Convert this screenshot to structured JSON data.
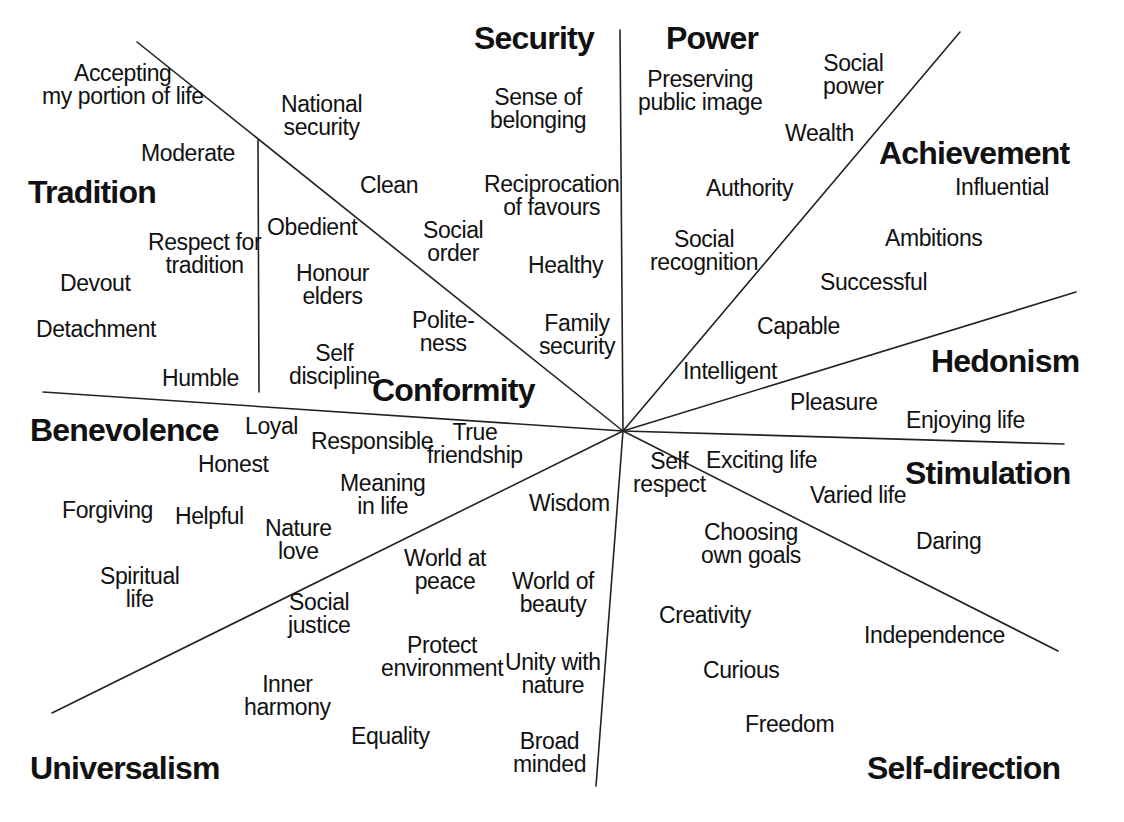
{
  "diagram": {
    "type": "radial-partition",
    "background": "#ffffff",
    "line_color": "#222222",
    "center": {
      "x": 623,
      "y": 431
    }
  },
  "domains": [
    {
      "id": "security",
      "label": "Security",
      "x": 474,
      "y": 22,
      "align": "l"
    },
    {
      "id": "power",
      "label": "Power",
      "x": 666,
      "y": 22,
      "align": "l"
    },
    {
      "id": "achievement",
      "label": "Achievement",
      "x": 879,
      "y": 137,
      "align": "l"
    },
    {
      "id": "hedonism",
      "label": "Hedonism",
      "x": 931,
      "y": 345,
      "align": "l"
    },
    {
      "id": "stimulation",
      "label": "Stimulation",
      "x": 905,
      "y": 457,
      "align": "l"
    },
    {
      "id": "self-direction",
      "label": "Self-direction",
      "x": 867,
      "y": 752,
      "align": "l"
    },
    {
      "id": "universalism",
      "label": "Universalism",
      "x": 30,
      "y": 752,
      "align": "l"
    },
    {
      "id": "benevolence",
      "label": "Benevolence",
      "x": 30,
      "y": 414,
      "align": "l"
    },
    {
      "id": "conformity",
      "label": "Conformity",
      "x": 372,
      "y": 374,
      "align": "l"
    },
    {
      "id": "tradition",
      "label": "Tradition",
      "x": 28,
      "y": 176,
      "align": "l"
    }
  ],
  "values": [
    {
      "domain": "tradition",
      "text": "Accepting\nmy portion of life",
      "x": 42,
      "y": 62,
      "align": "l"
    },
    {
      "domain": "tradition",
      "text": "Moderate",
      "x": 141,
      "y": 142,
      "align": "l"
    },
    {
      "domain": "tradition",
      "text": "Respect for\ntradition",
      "x": 148,
      "y": 231,
      "align": "l"
    },
    {
      "domain": "tradition",
      "text": "Devout",
      "x": 60,
      "y": 272,
      "align": "l"
    },
    {
      "domain": "tradition",
      "text": "Detachment",
      "x": 36,
      "y": 318,
      "align": "l"
    },
    {
      "domain": "tradition",
      "text": "Humble",
      "x": 162,
      "y": 367,
      "align": "l"
    },
    {
      "domain": "conformity",
      "text": "National\nsecurity",
      "x": 281,
      "y": 93,
      "align": "l"
    },
    {
      "domain": "conformity",
      "text": "Obedient",
      "x": 267,
      "y": 216,
      "align": "l"
    },
    {
      "domain": "conformity",
      "text": "Honour\nelders",
      "x": 296,
      "y": 262,
      "align": "l"
    },
    {
      "domain": "conformity",
      "text": "Self\ndiscipline",
      "x": 289,
      "y": 342,
      "align": "l"
    },
    {
      "domain": "conformity",
      "text": "Clean",
      "x": 360,
      "y": 174,
      "align": "l"
    },
    {
      "domain": "conformity",
      "text": "Social\norder",
      "x": 423,
      "y": 219,
      "align": "l"
    },
    {
      "domain": "conformity",
      "text": "Polite-\nness",
      "x": 412,
      "y": 309,
      "align": "l"
    },
    {
      "domain": "security",
      "text": "Sense of\nbelonging",
      "x": 490,
      "y": 86,
      "align": "l"
    },
    {
      "domain": "security",
      "text": "Reciprocation\nof favours",
      "x": 484,
      "y": 173,
      "align": "l"
    },
    {
      "domain": "security",
      "text": "Healthy",
      "x": 528,
      "y": 254,
      "align": "l"
    },
    {
      "domain": "security",
      "text": "Family\nsecurity",
      "x": 539,
      "y": 312,
      "align": "l"
    },
    {
      "domain": "power",
      "text": "Preserving\npublic image",
      "x": 638,
      "y": 68,
      "align": "l"
    },
    {
      "domain": "power",
      "text": "Social\npower",
      "x": 823,
      "y": 52,
      "align": "l"
    },
    {
      "domain": "power",
      "text": "Wealth",
      "x": 785,
      "y": 122,
      "align": "l"
    },
    {
      "domain": "power",
      "text": "Authority",
      "x": 706,
      "y": 177,
      "align": "l"
    },
    {
      "domain": "power",
      "text": "Social\nrecognition",
      "x": 650,
      "y": 228,
      "align": "l"
    },
    {
      "domain": "achievement",
      "text": "Influential",
      "x": 955,
      "y": 176,
      "align": "l"
    },
    {
      "domain": "achievement",
      "text": "Ambitions",
      "x": 885,
      "y": 227,
      "align": "l"
    },
    {
      "domain": "achievement",
      "text": "Successful",
      "x": 820,
      "y": 271,
      "align": "l"
    },
    {
      "domain": "achievement",
      "text": "Capable",
      "x": 757,
      "y": 315,
      "align": "l"
    },
    {
      "domain": "achievement",
      "text": "Intelligent",
      "x": 683,
      "y": 360,
      "align": "l"
    },
    {
      "domain": "hedonism",
      "text": "Pleasure",
      "x": 790,
      "y": 391,
      "align": "l"
    },
    {
      "domain": "hedonism",
      "text": "Enjoying life",
      "x": 906,
      "y": 409,
      "align": "l"
    },
    {
      "domain": "stimulation",
      "text": "Exciting life",
      "x": 706,
      "y": 449,
      "align": "l"
    },
    {
      "domain": "stimulation",
      "text": "Varied life",
      "x": 810,
      "y": 484,
      "align": "l"
    },
    {
      "domain": "stimulation",
      "text": "Daring",
      "x": 916,
      "y": 530,
      "align": "l"
    },
    {
      "domain": "self-direction",
      "text": "Self\nrespect",
      "x": 633,
      "y": 450,
      "align": "l"
    },
    {
      "domain": "self-direction",
      "text": "Choosing\nown goals",
      "x": 701,
      "y": 521,
      "align": "l"
    },
    {
      "domain": "self-direction",
      "text": "Creativity",
      "x": 659,
      "y": 604,
      "align": "l"
    },
    {
      "domain": "self-direction",
      "text": "Independence",
      "x": 864,
      "y": 624,
      "align": "l"
    },
    {
      "domain": "self-direction",
      "text": "Curious",
      "x": 703,
      "y": 659,
      "align": "l"
    },
    {
      "domain": "self-direction",
      "text": "Freedom",
      "x": 745,
      "y": 713,
      "align": "l"
    },
    {
      "domain": "universalism",
      "text": "Wisdom",
      "x": 529,
      "y": 492,
      "align": "l"
    },
    {
      "domain": "universalism",
      "text": "World of\nbeauty",
      "x": 512,
      "y": 570,
      "align": "l"
    },
    {
      "domain": "universalism",
      "text": "Unity with\nnature",
      "x": 505,
      "y": 651,
      "align": "l"
    },
    {
      "domain": "universalism",
      "text": "Broad\nminded",
      "x": 513,
      "y": 730,
      "align": "l"
    },
    {
      "domain": "universalism",
      "text": "World at\npeace",
      "x": 404,
      "y": 547,
      "align": "l"
    },
    {
      "domain": "universalism",
      "text": "Protect\nenvironment",
      "x": 381,
      "y": 634,
      "align": "l"
    },
    {
      "domain": "universalism",
      "text": "Equality",
      "x": 351,
      "y": 725,
      "align": "l"
    },
    {
      "domain": "universalism",
      "text": "Social\njustice",
      "x": 288,
      "y": 591,
      "align": "l"
    },
    {
      "domain": "universalism",
      "text": "Inner\nharmony",
      "x": 244,
      "y": 673,
      "align": "l"
    },
    {
      "domain": "benevolence",
      "text": "Loyal",
      "x": 245,
      "y": 415,
      "align": "l"
    },
    {
      "domain": "benevolence",
      "text": "Honest",
      "x": 198,
      "y": 453,
      "align": "l"
    },
    {
      "domain": "benevolence",
      "text": "Responsible",
      "x": 311,
      "y": 430,
      "align": "l"
    },
    {
      "domain": "benevolence",
      "text": "True\nfriendship",
      "x": 427,
      "y": 421,
      "align": "l"
    },
    {
      "domain": "benevolence",
      "text": "Meaning\nin life",
      "x": 340,
      "y": 472,
      "align": "l"
    },
    {
      "domain": "benevolence",
      "text": "Forgiving",
      "x": 62,
      "y": 499,
      "align": "l"
    },
    {
      "domain": "benevolence",
      "text": "Helpful",
      "x": 175,
      "y": 505,
      "align": "l"
    },
    {
      "domain": "benevolence",
      "text": "Nature\nlove",
      "x": 265,
      "y": 517,
      "align": "l"
    },
    {
      "domain": "benevolence",
      "text": "Spiritual\nlife",
      "x": 100,
      "y": 565,
      "align": "l"
    }
  ],
  "divider_lines": [
    {
      "id": "tradition-conformity",
      "x1": 258,
      "y1": 140,
      "x2": 259,
      "y2": 392
    },
    {
      "id": "conformity-security",
      "x1": 137,
      "y1": 42,
      "x2": 623,
      "y2": 431
    },
    {
      "id": "security-power",
      "x1": 620,
      "y1": 30,
      "x2": 623,
      "y2": 431
    },
    {
      "id": "power-achievement",
      "x1": 960,
      "y1": 32,
      "x2": 623,
      "y2": 431
    },
    {
      "id": "achievement-hedonism",
      "x1": 1076,
      "y1": 292,
      "x2": 623,
      "y2": 431
    },
    {
      "id": "hedonism-stimulation",
      "x1": 1064,
      "y1": 444,
      "x2": 623,
      "y2": 431
    },
    {
      "id": "stimulation-selfdir",
      "x1": 1058,
      "y1": 651,
      "x2": 623,
      "y2": 431
    },
    {
      "id": "selfdir-universalism",
      "x1": 596,
      "y1": 786,
      "x2": 623,
      "y2": 431
    },
    {
      "id": "universalism-benevolence",
      "x1": 52,
      "y1": 713,
      "x2": 623,
      "y2": 431
    },
    {
      "id": "benevolence-tradition",
      "x1": 43,
      "y1": 392,
      "x2": 623,
      "y2": 431
    }
  ]
}
